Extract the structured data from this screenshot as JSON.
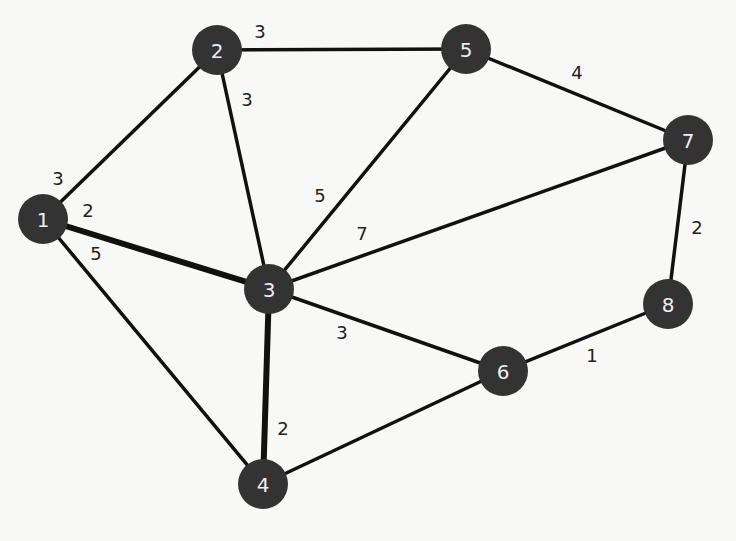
{
  "graph": {
    "type": "weighted-undirected",
    "node_radius": 25,
    "colors": {
      "node_fill": "#333333",
      "node_text": "#eeeeee",
      "edge": "#111111",
      "background": "#f8f8f6"
    },
    "nodes": [
      {
        "id": "1",
        "label": "1",
        "x": 43,
        "y": 219
      },
      {
        "id": "2",
        "label": "2",
        "x": 217,
        "y": 50
      },
      {
        "id": "3",
        "label": "3",
        "x": 269,
        "y": 289
      },
      {
        "id": "4",
        "label": "4",
        "x": 263,
        "y": 484
      },
      {
        "id": "5",
        "label": "5",
        "x": 466,
        "y": 49
      },
      {
        "id": "6",
        "label": "6",
        "x": 503,
        "y": 371
      },
      {
        "id": "7",
        "label": "7",
        "x": 688,
        "y": 140
      },
      {
        "id": "8",
        "label": "8",
        "x": 668,
        "y": 304
      }
    ],
    "edges": [
      {
        "from": "1",
        "to": "2",
        "weight": "3",
        "lx": 58,
        "ly": 178,
        "thick": false
      },
      {
        "from": "1",
        "to": "3",
        "weight": "2",
        "lx": 88,
        "ly": 210,
        "thick": true
      },
      {
        "from": "1",
        "to": "4",
        "weight": "5",
        "lx": 96,
        "ly": 253,
        "thick": false
      },
      {
        "from": "2",
        "to": "5",
        "weight": "3",
        "lx": 260,
        "ly": 31,
        "thick": false
      },
      {
        "from": "2",
        "to": "3",
        "weight": "3",
        "lx": 247,
        "ly": 99,
        "thick": false
      },
      {
        "from": "5",
        "to": "3",
        "weight": "5",
        "lx": 320,
        "ly": 195,
        "thick": false
      },
      {
        "from": "3",
        "to": "7",
        "weight": "7",
        "lx": 362,
        "ly": 233,
        "thick": false
      },
      {
        "from": "5",
        "to": "7",
        "weight": "4",
        "lx": 577,
        "ly": 72,
        "thick": false
      },
      {
        "from": "3",
        "to": "6",
        "weight": "3",
        "lx": 342,
        "ly": 332,
        "thick": false
      },
      {
        "from": "3",
        "to": "4",
        "weight": "2",
        "lx": 283,
        "ly": 428,
        "thick": true
      },
      {
        "from": "4",
        "to": "6",
        "weight": "",
        "lx": 0,
        "ly": 0,
        "thick": false
      },
      {
        "from": "6",
        "to": "8",
        "weight": "1",
        "lx": 592,
        "ly": 355,
        "thick": false
      },
      {
        "from": "7",
        "to": "8",
        "weight": "2",
        "lx": 697,
        "ly": 227,
        "thick": false
      }
    ]
  }
}
